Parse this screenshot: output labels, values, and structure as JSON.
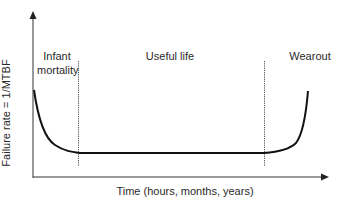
{
  "diagram": {
    "y_axis_label": "Failure rate = 1/MTBF",
    "x_axis_label": "Time (hours, months, years)",
    "regions": [
      {
        "label_line1": "Infant",
        "label_line2": "mortality"
      },
      {
        "label_line1": "Useful life",
        "label_line2": ""
      },
      {
        "label_line1": "Wearout",
        "label_line2": ""
      }
    ],
    "colors": {
      "curve": "#111111",
      "axes": "#333333",
      "dividers": "#555555"
    }
  }
}
